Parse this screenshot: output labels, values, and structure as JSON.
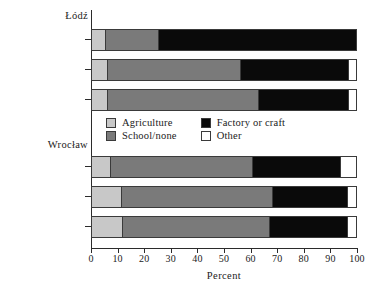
{
  "chart_data": {
    "type": "bar",
    "orientation": "horizontal",
    "stacked": true,
    "title": "",
    "xlabel": "Percent",
    "ylabel": "",
    "xlim": [
      0,
      100
    ],
    "grid": false,
    "legend_position": "center",
    "xticks": [
      0,
      10,
      20,
      30,
      40,
      50,
      60,
      70,
      80,
      90,
      100
    ],
    "xtick_labels": [
      "0",
      "10",
      "20",
      "30",
      "40",
      "50",
      "60",
      "70",
      "80",
      "90",
      "100"
    ],
    "series": [
      {
        "name": "Agriculture",
        "color": "#c8c8c8",
        "values": [
          5.0,
          5.5,
          5.5,
          7.0,
          11.0,
          11.5
        ]
      },
      {
        "name": "School/none",
        "color": "#7a7a7a",
        "values": [
          20.0,
          50.5,
          57.5,
          53.5,
          57.0,
          55.5
        ]
      },
      {
        "name": "Factory or craft",
        "color": "#0a0a0a",
        "values": [
          75.0,
          41.0,
          34.0,
          33.5,
          28.5,
          29.5
        ]
      },
      {
        "name": "Other",
        "color": "#ffffff",
        "values": [
          0.0,
          3.0,
          3.0,
          6.0,
          3.5,
          3.5
        ]
      }
    ],
    "groups": [
      {
        "name": "Łódź",
        "categories": [
          "PPS (n = 20)",
          "PPR (n = 68)",
          "All (n = 551)"
        ]
      },
      {
        "name": "Wrocław",
        "categories": [
          "PPS (n = 403)",
          "PPR (n = 1,147)",
          "All (n = 3,300)"
        ]
      }
    ],
    "categories": [
      "PPS (n = 20)",
      "PPR (n = 68)",
      "All (n = 551)",
      "PPS (n = 403)",
      "PPR (n = 1,147)",
      "All (n = 3,300)"
    ]
  },
  "groups": {
    "lodz": {
      "header": "Łódź"
    },
    "wroclaw": {
      "header": "Wrocław"
    }
  },
  "rows": [
    {
      "label": "PPS (n = 20)"
    },
    {
      "label": "PPR (n = 68)"
    },
    {
      "label": "All (n = 551)"
    },
    {
      "label": "PPS (n = 403)"
    },
    {
      "label": "PPR (n = 1,147)"
    },
    {
      "label": "All (n = 3,300)"
    }
  ],
  "legend": {
    "items": [
      {
        "label": "Agriculture",
        "color": "#c8c8c8"
      },
      {
        "label": "Factory or craft",
        "color": "#0a0a0a"
      },
      {
        "label": "School/none",
        "color": "#7a7a7a"
      },
      {
        "label": "Other",
        "color": "#ffffff"
      }
    ]
  },
  "axis": {
    "x_title": "Percent",
    "ticks": [
      "0",
      "10",
      "20",
      "30",
      "40",
      "50",
      "60",
      "70",
      "80",
      "90",
      "100"
    ]
  }
}
